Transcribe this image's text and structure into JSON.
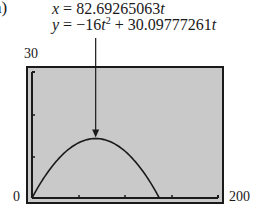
{
  "part_label": "a)",
  "equations": {
    "x_lhs": "x",
    "x_rhs_coef": "82.69265063",
    "x_var": "t",
    "y_lhs": "y",
    "y_term1_coef": "−16",
    "y_term1_var": "t",
    "y_term1_exp": "2",
    "y_term2_coef": "30.09777261",
    "y_term2_var": "t"
  },
  "axis_labels": {
    "ymax": "30",
    "origin": "0",
    "xmax": "200"
  },
  "colors": {
    "plot_background": "#c9c9c9",
    "frame": "#1a1a1a",
    "curve": "#1a1a1a"
  },
  "chart_data": {
    "type": "line",
    "title": "",
    "subtitle": "",
    "xlabel": "",
    "ylabel": "",
    "parametric": {
      "x": "82.69265063t",
      "y": "-16t^2 + 30.09777261t",
      "t_range": [
        0,
        1.881
      ]
    },
    "xlim": [
      0,
      200
    ],
    "ylim": [
      0,
      30
    ],
    "x_ticks": [
      0,
      50,
      100,
      150,
      200
    ],
    "y_ticks": [
      0,
      10,
      20,
      30
    ],
    "grid": false,
    "legend": null,
    "series": [
      {
        "name": "trajectory",
        "x": [
          0,
          15.5,
          31.0,
          46.5,
          62.0,
          77.8,
          93.0,
          108.5,
          124.0,
          139.5,
          155.5
        ],
        "y": [
          0,
          5.2,
          9.1,
          11.8,
          13.5,
          14.15,
          13.6,
          12.0,
          9.3,
          5.6,
          0
        ]
      }
    ],
    "annotations": [
      {
        "text": "x = 82.69265063t, y = -16t^2 + 30.09777261t",
        "arrow_to": [
          77.8,
          14.15
        ]
      }
    ]
  }
}
